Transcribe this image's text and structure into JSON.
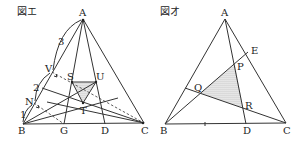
{
  "figures": [
    {
      "title": "図エ",
      "labels": {
        "A": "A",
        "B": "B",
        "C": "C",
        "D": "D",
        "G": "G",
        "S": "S",
        "T": "T",
        "U": "U",
        "V": "V",
        "N": "N"
      },
      "ratio_labels": {
        "r3": "3",
        "r2": "2",
        "r1": "1"
      }
    },
    {
      "title": "図オ",
      "labels": {
        "A": "A",
        "B": "B",
        "C": "C",
        "D": "D",
        "E": "E",
        "P": "P",
        "Q": "Q",
        "R": "R"
      }
    }
  ],
  "colors": {
    "line": "#333333",
    "shade": "#bfbfbf"
  }
}
